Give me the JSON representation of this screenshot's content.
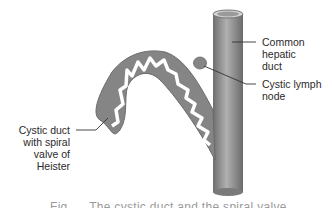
{
  "labels": {
    "common_hepatic_duct": "Common\nhepatic\nduct",
    "cystic_lymph_node": "Cystic lymph\nnode",
    "cystic_duct": "Cystic duct\nwith spiral\nvalve of\nHeister"
  },
  "caption": "Fig. ... The cystic duct and the spiral valve",
  "colors": {
    "duct_fill": "#8a8a8a",
    "duct_highlight": "#b5b5b5",
    "duct_shadow": "#6a6a6a",
    "label_text": "#2a2a2a",
    "leader_line": "#333333"
  }
}
